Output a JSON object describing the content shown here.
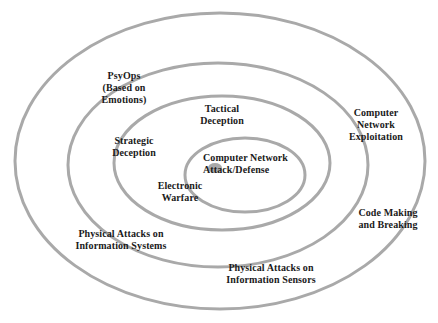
{
  "diagram": {
    "type": "concentric-ellipse-venn",
    "canvas": {
      "width": 438,
      "height": 323
    },
    "style": {
      "ring_stroke_color": "#a9a9a9",
      "ring_stroke_width": 3,
      "ring_fill": "none",
      "background_color": "#ffffff",
      "center_dot_color": "#a9a9a9",
      "text_color": "#1a1a1a"
    },
    "rings": [
      {
        "id": "ring-outer",
        "level": 1,
        "cx": 220,
        "cy": 161,
        "rx": 205,
        "ry": 148
      },
      {
        "id": "ring-second",
        "level": 2,
        "cx": 218,
        "cy": 165,
        "rx": 150,
        "ry": 102
      },
      {
        "id": "ring-third",
        "level": 3,
        "cx": 222,
        "cy": 163,
        "rx": 108,
        "ry": 67
      },
      {
        "id": "ring-inner",
        "level": 4,
        "cx": 245,
        "cy": 175,
        "rx": 60,
        "ry": 37
      }
    ],
    "center_dot": {
      "cx": 215,
      "cy": 168,
      "rx": 7,
      "ry": 5
    },
    "labels": {
      "psyops": "PsyOps\n(Based on\nEmotions)",
      "tactical_deception": "Tactical\nDeception",
      "strategic_deception": "Strategic\nDeception",
      "center": "Computer Network\nAttack/Defense",
      "electronic_warfare": "Electronic\nWarfare",
      "computer_network_exploitation": "Computer\nNetwork\nExploitation",
      "code_making_breaking": "Code Making\nand Breaking",
      "physical_attacks_systems": "Physical Attacks on\nInformation Systems",
      "physical_attacks_sensors": "Physical Attacks on\nInformation Sensors"
    }
  }
}
